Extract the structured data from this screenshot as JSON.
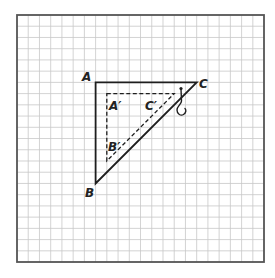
{
  "diagram": {
    "type": "geometry-grid",
    "grid": {
      "columns": 22,
      "rows": 22,
      "origin_px": [
        17,
        15
      ],
      "cell_px": 11.23,
      "line_color": "#c8c8c8",
      "border_color": "#555555"
    },
    "triangle_original": {
      "style": "solid",
      "color": "#1e1e1e",
      "vertices": {
        "A": [
          7,
          6
        ],
        "B": [
          7,
          15
        ],
        "C": [
          16,
          6
        ]
      }
    },
    "triangle_image": {
      "style": "dashed",
      "color": "#1e1e1e",
      "vertices": {
        "A'": [
          8,
          7
        ],
        "B'": [
          8,
          13
        ],
        "C'": [
          14,
          7
        ]
      }
    },
    "hook": {
      "icon": "hook-icon",
      "near_vertex": "C"
    },
    "labels": {
      "A": "A",
      "B": "B",
      "C": "C",
      "A_prime": "A′",
      "B_prime": "B′",
      "C_prime": "C′"
    }
  }
}
